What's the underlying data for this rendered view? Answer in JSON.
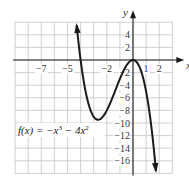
{
  "chart_data": {
    "type": "line",
    "title": "",
    "function_label": "f(x) = −x³ − 4x²",
    "function_label_parts": {
      "prefix": "f(x) = −x",
      "exp1": "3",
      "middle": " − 4x",
      "exp2": "2"
    },
    "xlabel": "x",
    "ylabel": "y",
    "xlim": [
      -9,
      3
    ],
    "ylim": [
      -18,
      6
    ],
    "grid": true,
    "grid_step_x": 1,
    "grid_step_y": 2,
    "x_tick_labels": [
      {
        "value": -7,
        "text": "−7"
      },
      {
        "value": -5,
        "text": "−5"
      },
      {
        "value": -2,
        "text": "−2"
      },
      {
        "value": 1,
        "text": "1"
      },
      {
        "value": 2,
        "text": "2"
      }
    ],
    "y_tick_labels": [
      {
        "value": 4,
        "text": "4"
      },
      {
        "value": 2,
        "text": "2"
      },
      {
        "value": -2,
        "text": "2"
      },
      {
        "value": -4,
        "text": "4"
      },
      {
        "value": -6,
        "text": "6"
      },
      {
        "value": -8,
        "text": "8"
      },
      {
        "value": -10,
        "text": "10"
      },
      {
        "value": -12,
        "text": "12"
      },
      {
        "value": -14,
        "text": "14"
      },
      {
        "value": -16,
        "text": "16"
      }
    ],
    "series": [
      {
        "name": "f(x) = −x³ − 4x²",
        "x": [
          -4.3,
          -4.2,
          -4.0,
          -3.75,
          -3.5,
          -3.25,
          -3.0,
          -2.67,
          -2.5,
          -2.25,
          -2.0,
          -1.75,
          -1.5,
          -1.25,
          -1.0,
          -0.75,
          -0.5,
          -0.25,
          0.0,
          0.25,
          0.5,
          0.75,
          1.0,
          1.25,
          1.5,
          1.75
        ],
        "y": [
          5.55,
          3.52,
          0.0,
          -3.52,
          -6.13,
          -7.92,
          -9.0,
          -9.48,
          -9.38,
          -8.86,
          -8.0,
          -6.89,
          -5.63,
          -4.3,
          -3.0,
          -1.83,
          -0.88,
          -0.23,
          0.0,
          -0.27,
          -1.13,
          -2.67,
          -5.0,
          -8.2,
          -12.38,
          -17.61
        ],
        "arrows": "both ends",
        "color": "#1a1a1a"
      }
    ],
    "key_points": {
      "local_min": {
        "x": -2.67,
        "y": -9.48
      },
      "local_max": {
        "x": 0,
        "y": 0
      },
      "x_intercepts": [
        -4,
        0
      ]
    }
  }
}
